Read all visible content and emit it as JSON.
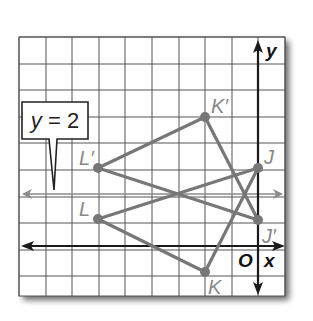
{
  "figure": {
    "type": "coordinate-grid-reflection",
    "grid": {
      "x_min": -9,
      "x_max": 1,
      "y_min": -2,
      "y_max": 8,
      "line_color": "#555555"
    },
    "axes": {
      "x_label": "x",
      "y_label": "y",
      "origin_label": "O",
      "color": "#1a1a1a"
    },
    "reflection_line": {
      "equation_var": "y",
      "equation_eq": " = 2",
      "label": "y = 2",
      "y": 2,
      "color": "#888888"
    },
    "triangle_color": "#777777",
    "points": [
      {
        "name": "J",
        "label": "J",
        "x": 0,
        "y": 3
      },
      {
        "name": "K",
        "label": "K",
        "x": -2,
        "y": -1
      },
      {
        "name": "L",
        "label": "L",
        "x": -6,
        "y": 1
      },
      {
        "name": "J-prime",
        "label": "J′",
        "x": 0,
        "y": 1
      },
      {
        "name": "K-prime",
        "label": "K′",
        "x": -2,
        "y": 5
      },
      {
        "name": "L-prime",
        "label": "L′",
        "x": -6,
        "y": 3
      }
    ]
  }
}
